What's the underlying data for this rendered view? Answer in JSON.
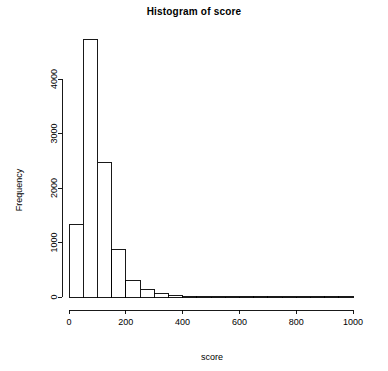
{
  "chart_data": {
    "type": "bar",
    "title": "Histogram of score",
    "xlabel": "score",
    "ylabel": "Frequency",
    "xlim": [
      0,
      1000
    ],
    "ylim": [
      0,
      4800
    ],
    "xticks": [
      0,
      200,
      400,
      600,
      800,
      1000
    ],
    "xtick_labels": [
      "0",
      "200",
      "400",
      "600",
      "800",
      "1000"
    ],
    "yticks": [
      0,
      1000,
      2000,
      3000,
      4000
    ],
    "ytick_labels": [
      "0",
      "1000",
      "2000",
      "3000",
      "4000"
    ],
    "grid": false,
    "legend": null,
    "bin_width": 50,
    "bin_edges": [
      0,
      50,
      100,
      150,
      200,
      250,
      300,
      350,
      400,
      450,
      500,
      550,
      600,
      650,
      700,
      750,
      800,
      850,
      900,
      950,
      1000
    ],
    "categories": [
      "0-50",
      "50-100",
      "100-150",
      "150-200",
      "200-250",
      "250-300",
      "300-350",
      "350-400",
      "400-450",
      "450-500",
      "500-550",
      "550-600",
      "600-650",
      "650-700",
      "700-750",
      "750-800",
      "800-850",
      "850-900",
      "900-950",
      "950-1000"
    ],
    "values": [
      1330,
      4730,
      2470,
      880,
      300,
      140,
      60,
      20,
      10,
      8,
      5,
      4,
      3,
      2,
      2,
      1,
      1,
      1,
      1,
      1
    ],
    "bar_fill": "#ffffff",
    "bar_stroke": "#000000",
    "background": "#ffffff"
  }
}
